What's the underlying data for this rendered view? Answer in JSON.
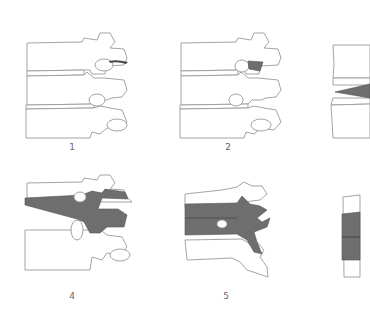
{
  "figure": {
    "panels": [
      {
        "id": 1,
        "label": "1",
        "stage": "small dark mark at upper facet joint"
      },
      {
        "id": 2,
        "label": "2",
        "stage": "shaded wedge at upper facet joint"
      },
      {
        "id": 3,
        "label": "3",
        "stage": "shaded wedge in disc space (partially cropped)"
      },
      {
        "id": 4,
        "label": "4",
        "stage": "shaded region spanning disc and posterior elements"
      },
      {
        "id": 5,
        "label": "5",
        "stage": "shaded band across full segment with posterior extension"
      },
      {
        "id": 6,
        "label": "6",
        "stage": "shaded vertebral body (partially cropped)"
      }
    ],
    "colors": {
      "background": "#ffffff",
      "outline": "#9a9a9a",
      "lesion_fill": "#6e6e6e",
      "label_text": "#666666"
    }
  }
}
